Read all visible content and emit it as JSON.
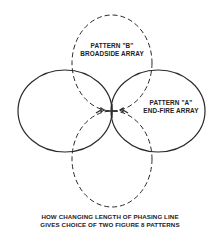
{
  "diagram": {
    "pattern_b": {
      "line1": "PATTERN \"B\"",
      "line2": "BROADSIDE ARRAY",
      "style": "dashed"
    },
    "pattern_a": {
      "line1": "PATTERN \"A\"",
      "line2": "END-FIRE ARRAY",
      "style": "solid"
    },
    "caption": {
      "line1": "HOW CHANGING LENGTH OF PHASING LINE",
      "line2": "GIVES CHOICE OF TWO FIGURE 8 PATTERNS"
    },
    "colors": {
      "stroke": "#2a2a2a",
      "text": "#222222",
      "background": "#ffffff"
    }
  }
}
